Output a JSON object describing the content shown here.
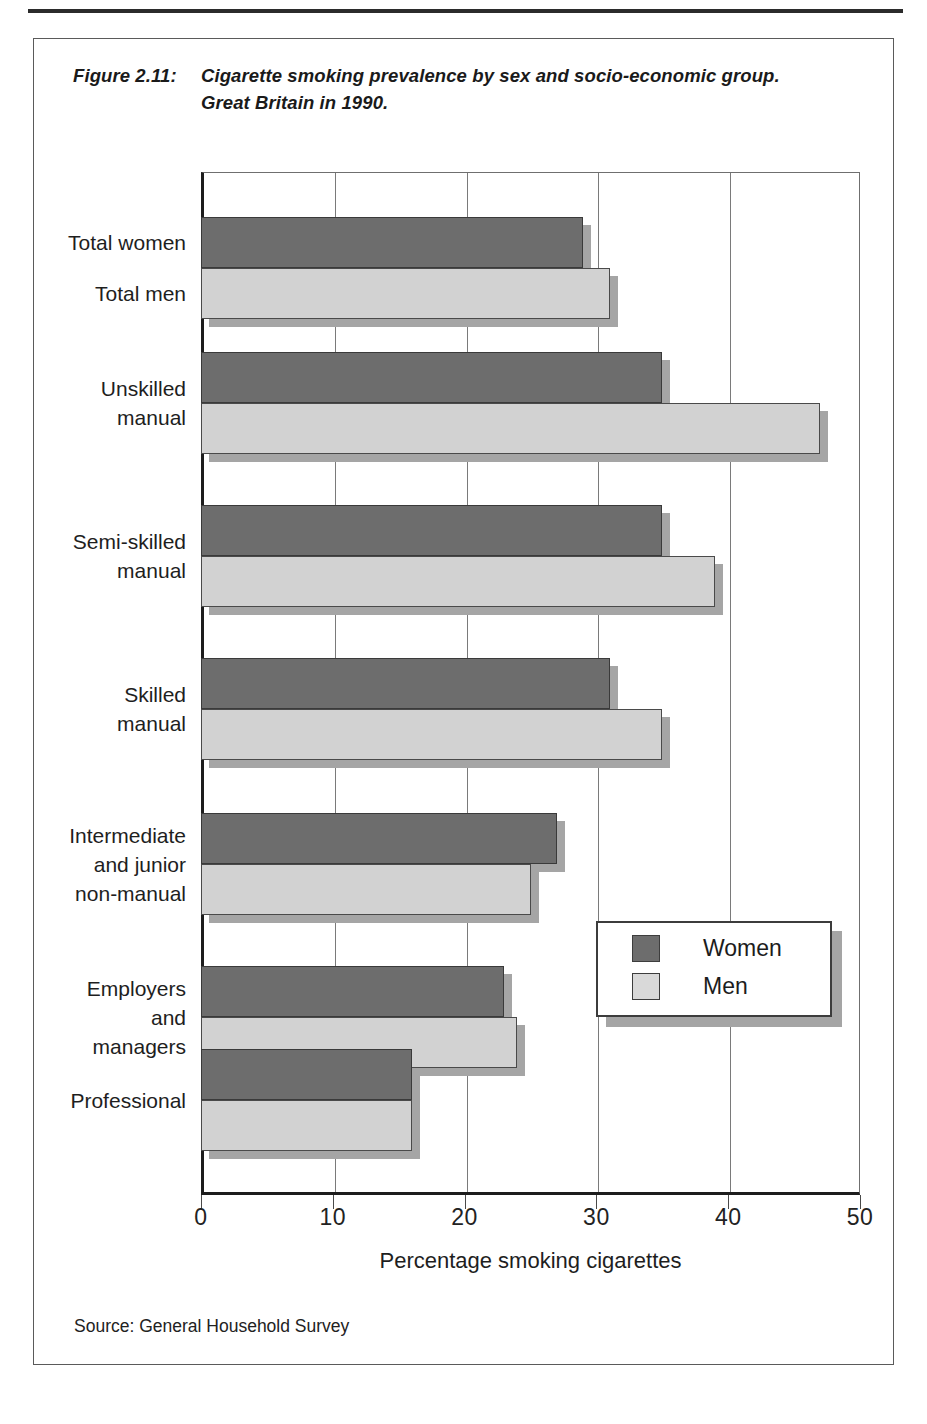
{
  "figure": {
    "label": "Figure 2.11:",
    "title_line1": "Cigarette smoking prevalence by sex and socio-economic group.",
    "title_line2": "Great Britain in 1990."
  },
  "source": "Source: General Household Survey",
  "legend": {
    "position": "inside-right",
    "entries": [
      {
        "name": "women-swatch",
        "label": "Women",
        "color": "#6d6d6d"
      },
      {
        "name": "men-swatch",
        "label": "Men",
        "color": "#d9d9d9"
      }
    ]
  },
  "chart_data": {
    "type": "bar",
    "orientation": "horizontal",
    "xlabel": "Percentage smoking cigarettes",
    "ylabel": "",
    "xlim": [
      0,
      50
    ],
    "xticks": [
      0,
      10,
      20,
      30,
      40,
      50
    ],
    "xtick_labels": [
      "0",
      "10",
      "20",
      "30",
      "40",
      "50"
    ],
    "grid": "vertical",
    "legend_position": "inside-right",
    "categories": [
      "Total women / Total men",
      "Unskilled manual",
      "Semi-skilled manual",
      "Skilled manual",
      "Intermediate and junior non-manual",
      "Employers and managers",
      "Professional"
    ],
    "category_labels": [
      [
        "Total women",
        "Total men"
      ],
      [
        "Unskilled",
        "manual"
      ],
      [
        "Semi-skilled",
        "manual"
      ],
      [
        "Skilled",
        "manual"
      ],
      [
        "Intermediate",
        "and junior",
        "non-manual"
      ],
      [
        "Employers",
        "and",
        "managers"
      ],
      [
        "Professional"
      ]
    ],
    "series": [
      {
        "name": "Women",
        "color": "#6d6d6d",
        "values": [
          29,
          35,
          35,
          31,
          27,
          23,
          16
        ]
      },
      {
        "name": "Men",
        "color": "#d2d2d2",
        "values": [
          31,
          47,
          39,
          35,
          25,
          24,
          16
        ]
      }
    ]
  }
}
